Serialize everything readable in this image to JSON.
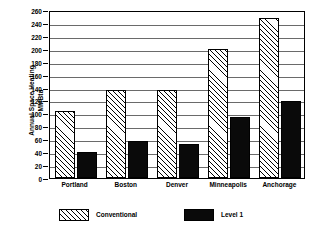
{
  "chart_data": {
    "type": "bar",
    "title": "",
    "xlabel": "",
    "ylabel": "Annual Space Heating MMBtu",
    "ylabel_line1": "Annual Space Heating",
    "ylabel_line2": "MMBtu",
    "categories": [
      "Portland",
      "Boston",
      "Denver",
      "Minneapolis",
      "Anchorage"
    ],
    "series": [
      {
        "name": "Conventional",
        "values": [
          103,
          136,
          136,
          199,
          247
        ],
        "fill": "diagonal-hatch",
        "color": "#000000"
      },
      {
        "name": "Level 1",
        "values": [
          41,
          58,
          53,
          94,
          119
        ],
        "fill": "solid",
        "color": "#0a0a0a"
      }
    ],
    "ylim": [
      0,
      260
    ],
    "ytick_step": 20,
    "yticks": [
      0,
      20,
      40,
      60,
      80,
      100,
      120,
      140,
      160,
      180,
      200,
      220,
      240,
      260
    ],
    "ytick_labels": [
      "0",
      "20",
      "40",
      "60",
      "80",
      "100",
      "120",
      "140",
      "160",
      "180",
      "200",
      "220",
      "240",
      "260"
    ],
    "grid": true,
    "grid_axis": "y",
    "legend_position": "bottom",
    "legend_entries": [
      "Conventional",
      "Level 1"
    ],
    "frame": true
  }
}
